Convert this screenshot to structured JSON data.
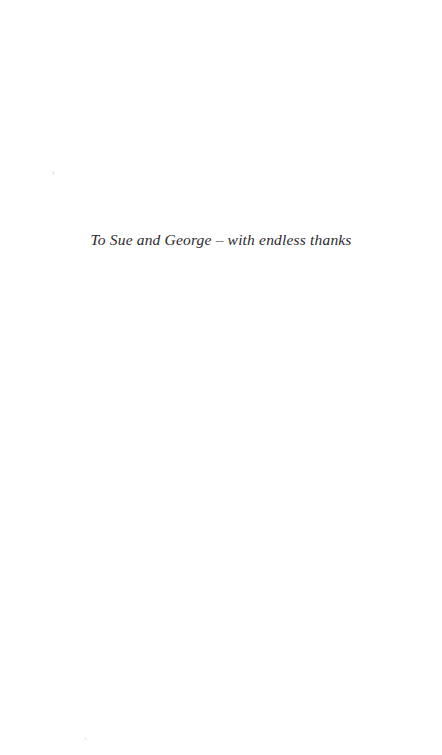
{
  "page": {
    "type": "book-dedication-page",
    "background_color": "#ffffff",
    "width_px": 442,
    "height_px": 755
  },
  "dedication": {
    "text": "To Sue and George – with endless thanks",
    "style": "italic-serif",
    "alignment": "center",
    "text_color": "#2b2a2c"
  },
  "artifacts": {
    "speck_upper_left": "",
    "speck_lower_left": ""
  }
}
